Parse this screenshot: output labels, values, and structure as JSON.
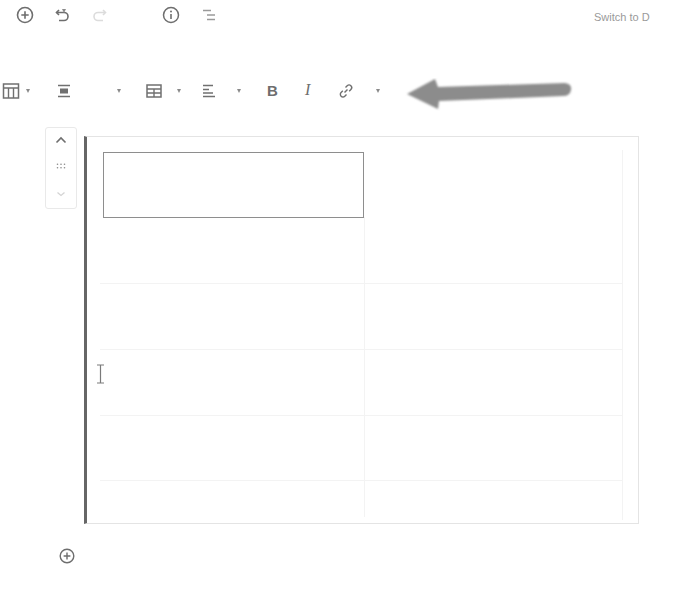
{
  "top_toolbar": {
    "icons": [
      {
        "name": "add-block-icon",
        "glyph": "plus-circle",
        "enabled": true
      },
      {
        "name": "undo-icon",
        "glyph": "undo",
        "enabled": true
      },
      {
        "name": "redo-icon",
        "glyph": "redo",
        "enabled": false
      },
      {
        "name": "info-icon",
        "glyph": "info-circle",
        "enabled": true
      },
      {
        "name": "outline-icon",
        "glyph": "list-outline",
        "enabled": true
      }
    ],
    "switch_label": "Switch to D"
  },
  "block_toolbar": {
    "items": [
      {
        "name": "change-block-type",
        "glyph": "table",
        "has_dropdown": true
      },
      {
        "name": "change-alignment",
        "glyph": "align-center",
        "has_dropdown": true
      },
      {
        "name": "edit-table",
        "glyph": "table-edit",
        "has_dropdown": true
      },
      {
        "name": "change-column-alignment",
        "glyph": "align-left",
        "has_dropdown": true
      },
      {
        "name": "bold",
        "glyph": "B"
      },
      {
        "name": "italic",
        "glyph": "I"
      },
      {
        "name": "link",
        "glyph": "link"
      },
      {
        "name": "more-rich-text",
        "glyph": "chevron-down",
        "has_dropdown": true
      }
    ],
    "bold_label": "B",
    "italic_label": "I"
  },
  "annotation": {
    "type": "arrow",
    "direction": "left",
    "color": "#8a8a8a"
  },
  "block_mover": {
    "move_up": "chevron-up-icon",
    "drag": "drag-handle-icon",
    "move_down": "chevron-down-icon"
  },
  "table_block": {
    "columns": 2,
    "rows": 6,
    "selected_cell": {
      "row": 1,
      "col": 1,
      "text": ""
    },
    "border_color": "#666666"
  },
  "footer": {
    "add_block_icon": "plus-circle"
  }
}
